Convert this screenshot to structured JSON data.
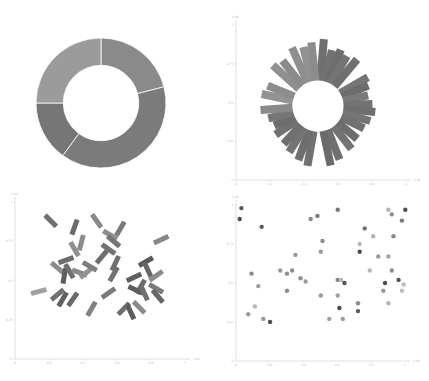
{
  "chart_data": [
    {
      "type": "pie",
      "variant": "donut",
      "title": "",
      "slices": [
        {
          "label": "A",
          "value": 21,
          "color": "#8a8a8a"
        },
        {
          "label": "B",
          "value": 39,
          "color": "#7b7b7b"
        },
        {
          "label": "C",
          "value": 15,
          "color": "#767676"
        },
        {
          "label": "D",
          "value": 25,
          "color": "#9b9b9b"
        }
      ],
      "start_angle_deg": 0,
      "direction": "clockwise",
      "inner_radius_ratio": 0.58
    },
    {
      "type": "bar",
      "variant": "radial",
      "title": "",
      "xlabel": "",
      "ylabel": "",
      "x_ticks": [
        "0",
        "0.2",
        "0.4",
        "0.6",
        "0.8",
        "1"
      ],
      "y_ticks": [
        "0",
        "0.25",
        "0.5",
        "0.75",
        "1"
      ],
      "xlim": [
        0,
        1
      ],
      "ylim": [
        0,
        1
      ],
      "axis_end_label": "1.00",
      "center": [
        0.5,
        0.5
      ],
      "inner_radius": 0.16,
      "bars": [
        {
          "angle": 5,
          "length": 0.26,
          "color": "#707070"
        },
        {
          "angle": 14,
          "length": 0.2,
          "color": "#727272"
        },
        {
          "angle": 22,
          "length": 0.22,
          "color": "#6e6e6e"
        },
        {
          "angle": 30,
          "length": 0.2,
          "color": "#747474"
        },
        {
          "angle": 40,
          "length": 0.22,
          "color": "#707070"
        },
        {
          "angle": 60,
          "length": 0.2,
          "color": "#767676"
        },
        {
          "angle": 68,
          "length": 0.18,
          "color": "#6c6c6c"
        },
        {
          "angle": 78,
          "length": 0.16,
          "color": "#7a7a7a"
        },
        {
          "angle": 88,
          "length": 0.18,
          "color": "#737373"
        },
        {
          "angle": 96,
          "length": 0.2,
          "color": "#6f6f6f"
        },
        {
          "angle": 106,
          "length": 0.18,
          "color": "#757575"
        },
        {
          "angle": 116,
          "length": 0.16,
          "color": "#717171"
        },
        {
          "angle": 130,
          "length": 0.16,
          "color": "#6d6d6d"
        },
        {
          "angle": 142,
          "length": 0.18,
          "color": "#737373"
        },
        {
          "angle": 158,
          "length": 0.2,
          "color": "#707070"
        },
        {
          "angle": 168,
          "length": 0.22,
          "color": "#6b6b6b"
        },
        {
          "angle": 190,
          "length": 0.22,
          "color": "#717171"
        },
        {
          "angle": 200,
          "length": 0.2,
          "color": "#6e6e6e"
        },
        {
          "angle": 212,
          "length": 0.18,
          "color": "#747474"
        },
        {
          "angle": 222,
          "length": 0.16,
          "color": "#707070"
        },
        {
          "angle": 236,
          "length": 0.16,
          "color": "#727272"
        },
        {
          "angle": 246,
          "length": 0.14,
          "color": "#6d6d6d"
        },
        {
          "angle": 256,
          "length": 0.16,
          "color": "#767676"
        },
        {
          "angle": 266,
          "length": 0.2,
          "color": "#8a8a8a"
        },
        {
          "angle": 282,
          "length": 0.2,
          "color": "#939393"
        },
        {
          "angle": 292,
          "length": 0.18,
          "color": "#8d8d8d"
        },
        {
          "angle": 312,
          "length": 0.22,
          "color": "#909090"
        },
        {
          "angle": 322,
          "length": 0.2,
          "color": "#8b8b8b"
        },
        {
          "angle": 336,
          "length": 0.24,
          "color": "#8f8f8f"
        },
        {
          "angle": 346,
          "length": 0.22,
          "color": "#929292"
        },
        {
          "angle": 354,
          "length": 0.24,
          "color": "#8c8c8c"
        }
      ]
    },
    {
      "type": "scatter",
      "variant": "rotated-rectangles",
      "title": "",
      "xlabel": "",
      "ylabel": "",
      "x_ticks": [
        "0",
        "0.2",
        "0.4",
        "0.6",
        "0.8",
        "1"
      ],
      "y_ticks": [
        "0",
        "0.25",
        "0.5",
        "0.75",
        "1"
      ],
      "xlim": [
        0,
        1
      ],
      "ylim": [
        0,
        1
      ],
      "axis_end_label": "1.00",
      "marks": [
        {
          "x": 0.21,
          "y": 0.88,
          "angle": 45,
          "color": "#6f6f6f"
        },
        {
          "x": 0.35,
          "y": 0.84,
          "angle": -70,
          "color": "#6a6a6a"
        },
        {
          "x": 0.48,
          "y": 0.88,
          "angle": 55,
          "color": "#8a8a8a"
        },
        {
          "x": 0.56,
          "y": 0.79,
          "angle": 30,
          "color": "#8e8e8e"
        },
        {
          "x": 0.62,
          "y": 0.83,
          "angle": -60,
          "color": "#7a7a7a"
        },
        {
          "x": 0.58,
          "y": 0.75,
          "angle": 40,
          "color": "#767676"
        },
        {
          "x": 0.39,
          "y": 0.74,
          "angle": -75,
          "color": "#8c8c8c"
        },
        {
          "x": 0.35,
          "y": 0.7,
          "angle": 60,
          "color": "#8f8f8f"
        },
        {
          "x": 0.55,
          "y": 0.7,
          "angle": 35,
          "color": "#737373"
        },
        {
          "x": 0.51,
          "y": 0.65,
          "angle": -50,
          "color": "#6e6e6e"
        },
        {
          "x": 0.86,
          "y": 0.76,
          "angle": -25,
          "color": "#888888"
        },
        {
          "x": 0.3,
          "y": 0.63,
          "angle": -20,
          "color": "#6c6c6c"
        },
        {
          "x": 0.25,
          "y": 0.58,
          "angle": 40,
          "color": "#8d8d8d"
        },
        {
          "x": 0.29,
          "y": 0.53,
          "angle": -80,
          "color": "#5e5e5e"
        },
        {
          "x": 0.32,
          "y": 0.56,
          "angle": 60,
          "color": "#707070"
        },
        {
          "x": 0.38,
          "y": 0.55,
          "angle": 20,
          "color": "#8a8a8a"
        },
        {
          "x": 0.42,
          "y": 0.55,
          "angle": -40,
          "color": "#929292"
        },
        {
          "x": 0.44,
          "y": 0.59,
          "angle": 30,
          "color": "#7d7d7d"
        },
        {
          "x": 0.59,
          "y": 0.61,
          "angle": -65,
          "color": "#707070"
        },
        {
          "x": 0.58,
          "y": 0.54,
          "angle": -60,
          "color": "#737373"
        },
        {
          "x": 0.77,
          "y": 0.62,
          "angle": -30,
          "color": "#5a5a5a"
        },
        {
          "x": 0.78,
          "y": 0.57,
          "angle": 65,
          "color": "#676767"
        },
        {
          "x": 0.83,
          "y": 0.53,
          "angle": -35,
          "color": "#8b8b8b"
        },
        {
          "x": 0.7,
          "y": 0.52,
          "angle": -25,
          "color": "#5f5f5f"
        },
        {
          "x": 0.74,
          "y": 0.46,
          "angle": -60,
          "color": "#6b6b6b"
        },
        {
          "x": 0.71,
          "y": 0.44,
          "angle": 25,
          "color": "#5c5c5c"
        },
        {
          "x": 0.76,
          "y": 0.42,
          "angle": 65,
          "color": "#6f6f6f"
        },
        {
          "x": 0.83,
          "y": 0.45,
          "angle": 30,
          "color": "#7b7b7b"
        },
        {
          "x": 0.84,
          "y": 0.4,
          "angle": 50,
          "color": "#666666"
        },
        {
          "x": 0.14,
          "y": 0.43,
          "angle": -15,
          "color": "#a0a0a0"
        },
        {
          "x": 0.25,
          "y": 0.41,
          "angle": -40,
          "color": "#707070"
        },
        {
          "x": 0.28,
          "y": 0.38,
          "angle": -60,
          "color": "#606060"
        },
        {
          "x": 0.34,
          "y": 0.38,
          "angle": -55,
          "color": "#6a6a6a"
        },
        {
          "x": 0.55,
          "y": 0.42,
          "angle": -35,
          "color": "#7b7b7b"
        },
        {
          "x": 0.45,
          "y": 0.32,
          "angle": -60,
          "color": "#828282"
        },
        {
          "x": 0.64,
          "y": 0.32,
          "angle": -45,
          "color": "#707070"
        },
        {
          "x": 0.68,
          "y": 0.3,
          "angle": 65,
          "color": "#5d5d5d"
        },
        {
          "x": 0.73,
          "y": 0.33,
          "angle": 45,
          "color": "#8b8b8b"
        }
      ]
    },
    {
      "type": "scatter",
      "title": "",
      "xlabel": "",
      "ylabel": "",
      "x_ticks": [
        "0",
        "0.2",
        "0.4",
        "0.6",
        "0.8",
        "1"
      ],
      "y_ticks": [
        "0",
        "0.25",
        "0.5",
        "0.75",
        "1"
      ],
      "xlim": [
        0,
        1
      ],
      "ylim": [
        0,
        1
      ],
      "axis_end_label": "1.00",
      "points": [
        {
          "x": 0.01,
          "y": 0.91,
          "color": "#4e4e4e"
        },
        {
          "x": 0.02,
          "y": 0.98,
          "color": "#555555"
        },
        {
          "x": 0.14,
          "y": 0.86,
          "color": "#5a5a5a"
        },
        {
          "x": 0.43,
          "y": 0.91,
          "color": "#8a8a8a"
        },
        {
          "x": 0.47,
          "y": 0.93,
          "color": "#7a7a7a"
        },
        {
          "x": 0.59,
          "y": 0.97,
          "color": "#777777"
        },
        {
          "x": 0.89,
          "y": 0.97,
          "color": "#b5b5b5"
        },
        {
          "x": 0.91,
          "y": 0.94,
          "color": "#8c8c8c"
        },
        {
          "x": 0.99,
          "y": 0.97,
          "color": "#4c4c4c"
        },
        {
          "x": 0.97,
          "y": 0.9,
          "color": "#7a7a7a"
        },
        {
          "x": 0.75,
          "y": 0.85,
          "color": "#707070"
        },
        {
          "x": 0.8,
          "y": 0.8,
          "color": "#b3b3b3"
        },
        {
          "x": 0.92,
          "y": 0.8,
          "color": "#8b8b8b"
        },
        {
          "x": 0.5,
          "y": 0.77,
          "color": "#8c8c8c"
        },
        {
          "x": 0.72,
          "y": 0.75,
          "color": "#b9b9b9"
        },
        {
          "x": 0.72,
          "y": 0.7,
          "color": "#4d4d4d"
        },
        {
          "x": 0.49,
          "y": 0.7,
          "color": "#9a9a9a"
        },
        {
          "x": 0.34,
          "y": 0.68,
          "color": "#969696"
        },
        {
          "x": 0.83,
          "y": 0.67,
          "color": "#9a9a9a"
        },
        {
          "x": 0.89,
          "y": 0.67,
          "color": "#a2a2a2"
        },
        {
          "x": 0.08,
          "y": 0.56,
          "color": "#898989"
        },
        {
          "x": 0.25,
          "y": 0.58,
          "color": "#999999"
        },
        {
          "x": 0.29,
          "y": 0.56,
          "color": "#8f8f8f"
        },
        {
          "x": 0.32,
          "y": 0.58,
          "color": "#8d8d8d"
        },
        {
          "x": 0.37,
          "y": 0.53,
          "color": "#909090"
        },
        {
          "x": 0.4,
          "y": 0.51,
          "color": "#9c9c9c"
        },
        {
          "x": 0.59,
          "y": 0.52,
          "color": "#858585"
        },
        {
          "x": 0.61,
          "y": 0.52,
          "color": "#b8b8b8"
        },
        {
          "x": 0.63,
          "y": 0.5,
          "color": "#525252"
        },
        {
          "x": 0.78,
          "y": 0.58,
          "color": "#b8b8b8"
        },
        {
          "x": 0.91,
          "y": 0.58,
          "color": "#909090"
        },
        {
          "x": 0.87,
          "y": 0.5,
          "color": "#4f4f4f"
        },
        {
          "x": 0.95,
          "y": 0.52,
          "color": "#545454"
        },
        {
          "x": 0.98,
          "y": 0.49,
          "color": "#bdbdbd"
        },
        {
          "x": 0.12,
          "y": 0.48,
          "color": "#9b9b9b"
        },
        {
          "x": 0.29,
          "y": 0.45,
          "color": "#8c8c8c"
        },
        {
          "x": 0.49,
          "y": 0.42,
          "color": "#999999"
        },
        {
          "x": 0.59,
          "y": 0.42,
          "color": "#a0a0a0"
        },
        {
          "x": 0.86,
          "y": 0.45,
          "color": "#9b9b9b"
        },
        {
          "x": 0.97,
          "y": 0.45,
          "color": "#bdbdbd"
        },
        {
          "x": 0.1,
          "y": 0.35,
          "color": "#b5b5b5"
        },
        {
          "x": 0.06,
          "y": 0.3,
          "color": "#9c9c9c"
        },
        {
          "x": 0.15,
          "y": 0.27,
          "color": "#9a9a9a"
        },
        {
          "x": 0.19,
          "y": 0.25,
          "color": "#4f4f4f"
        },
        {
          "x": 0.54,
          "y": 0.27,
          "color": "#a0a0a0"
        },
        {
          "x": 0.62,
          "y": 0.27,
          "color": "#9a9a9a"
        },
        {
          "x": 0.6,
          "y": 0.34,
          "color": "#4d4d4d"
        },
        {
          "x": 0.71,
          "y": 0.37,
          "color": "#8c8c8c"
        },
        {
          "x": 0.71,
          "y": 0.32,
          "color": "#5a5a5a"
        },
        {
          "x": 0.89,
          "y": 0.37,
          "color": "#b3b3b3"
        }
      ]
    }
  ]
}
